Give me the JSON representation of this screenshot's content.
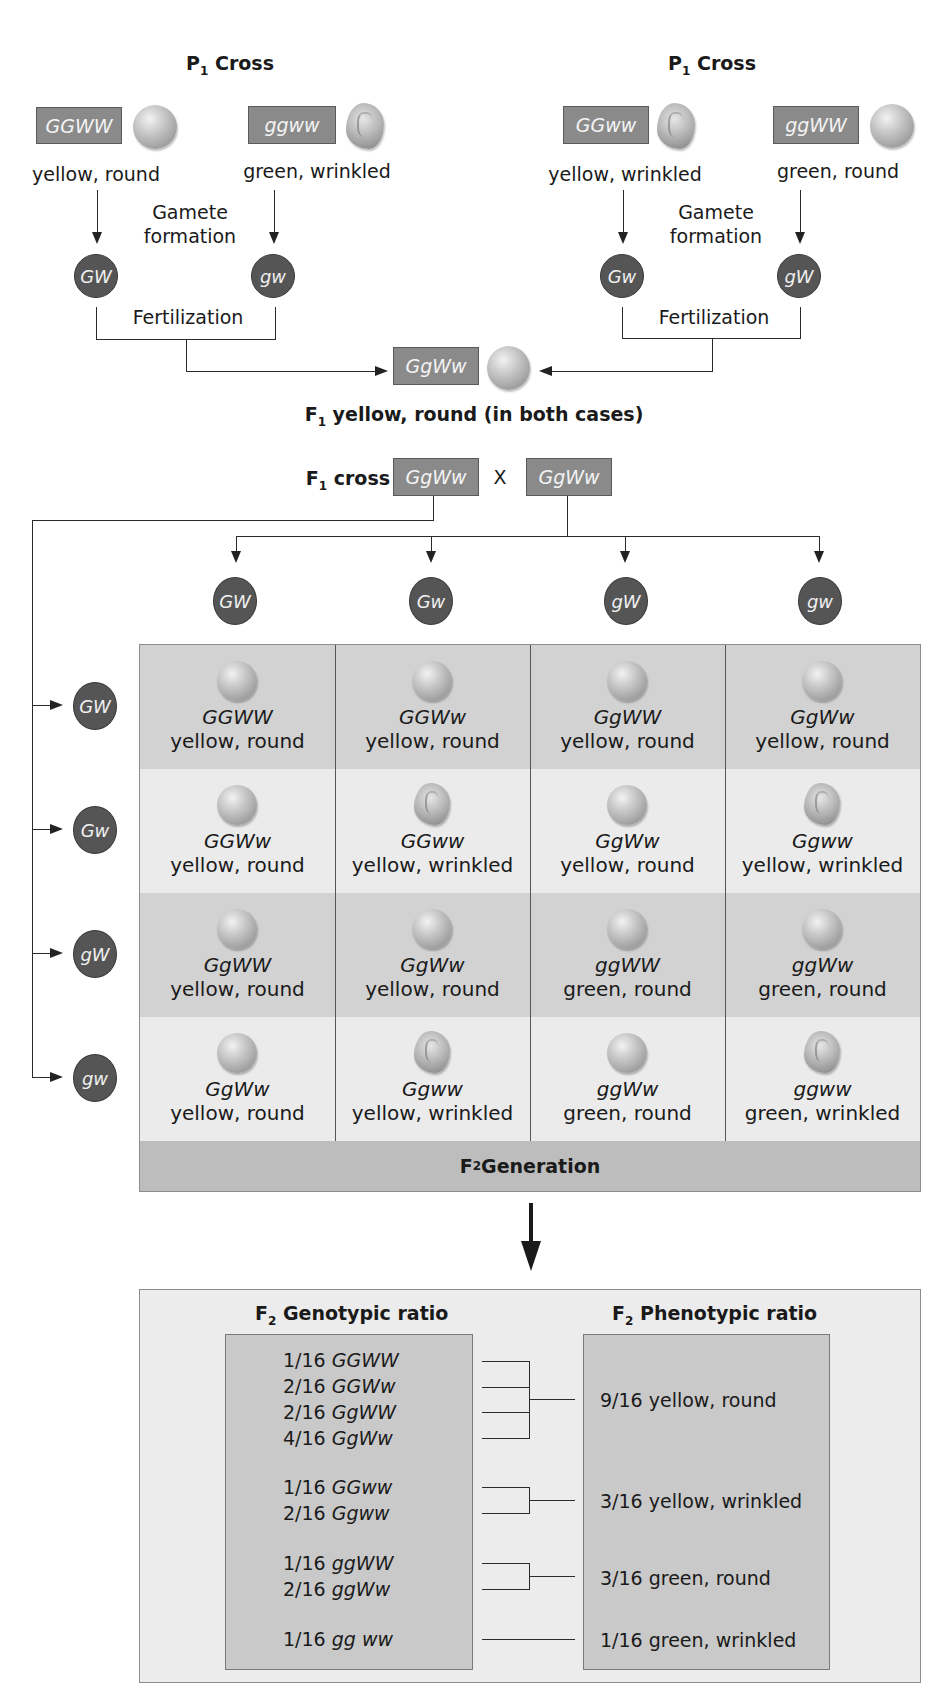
{
  "p1_crosses": [
    {
      "title": "P",
      "title_sub": "1",
      "title_suffix": " Cross",
      "parents": [
        {
          "genotype": "GGWW",
          "phenotype": "yellow, round",
          "seed_shape": "round"
        },
        {
          "genotype": "ggww",
          "phenotype": "green, wrinkled",
          "seed_shape": "wrinkled"
        }
      ],
      "gamete_label": "Gamete formation",
      "gametes": [
        "GW",
        "gw"
      ],
      "fertilization_label": "Fertilization"
    },
    {
      "title": "P",
      "title_sub": "1",
      "title_suffix": " Cross",
      "parents": [
        {
          "genotype": "GGww",
          "phenotype": "yellow, wrinkled",
          "seed_shape": "wrinkled"
        },
        {
          "genotype": "ggWW",
          "phenotype": "green, round",
          "seed_shape": "round"
        }
      ],
      "gamete_label": "Gamete formation",
      "gametes": [
        "Gw",
        "gW"
      ],
      "fertilization_label": "Fertilization"
    }
  ],
  "f1": {
    "genotype": "GgWw",
    "caption_prefix": "F",
    "caption_sub": "1",
    "caption_text": " yellow, round (in both cases)"
  },
  "f1_cross": {
    "label_prefix": "F",
    "label_sub": "1",
    "label_text": " cross",
    "left": "GgWw",
    "operator": "X",
    "right": "GgWw"
  },
  "punnett": {
    "column_gametes": [
      "GW",
      "Gw",
      "gW",
      "gw"
    ],
    "row_gametes": [
      "GW",
      "Gw",
      "gW",
      "gw"
    ],
    "rows": [
      [
        {
          "genotype": "GGWW",
          "phenotype": "yellow, round",
          "shape": "round"
        },
        {
          "genotype": "GGWw",
          "phenotype": "yellow, round",
          "shape": "round"
        },
        {
          "genotype": "GgWW",
          "phenotype": "yellow, round",
          "shape": "round"
        },
        {
          "genotype": "GgWw",
          "phenotype": "yellow, round",
          "shape": "round"
        }
      ],
      [
        {
          "genotype": "GGWw",
          "phenotype": "yellow, round",
          "shape": "round"
        },
        {
          "genotype": "GGww",
          "phenotype": "yellow, wrinkled",
          "shape": "wrinkled"
        },
        {
          "genotype": "GgWw",
          "phenotype": "yellow, round",
          "shape": "round"
        },
        {
          "genotype": "Ggww",
          "phenotype": "yellow, wrinkled",
          "shape": "wrinkled"
        }
      ],
      [
        {
          "genotype": "GgWW",
          "phenotype": "yellow, round",
          "shape": "round"
        },
        {
          "genotype": "GgWw",
          "phenotype": "yellow, round",
          "shape": "round"
        },
        {
          "genotype": "ggWW",
          "phenotype": "green, round",
          "shape": "round"
        },
        {
          "genotype": "ggWw",
          "phenotype": "green, round",
          "shape": "round"
        }
      ],
      [
        {
          "genotype": "GgWw",
          "phenotype": "yellow, round",
          "shape": "round"
        },
        {
          "genotype": "Ggww",
          "phenotype": "yellow, wrinkled",
          "shape": "wrinkled"
        },
        {
          "genotype": "ggWw",
          "phenotype": "green, round",
          "shape": "round"
        },
        {
          "genotype": "ggww",
          "phenotype": "green, wrinkled",
          "shape": "wrinkled"
        }
      ]
    ],
    "footer_prefix": "F",
    "footer_sub": "2",
    "footer_text": " Generation"
  },
  "ratios": {
    "genotypic_title_prefix": "F",
    "genotypic_title_sub": "2",
    "genotypic_title_text": " Genotypic ratio",
    "phenotypic_title_prefix": "F",
    "phenotypic_title_sub": "2",
    "phenotypic_title_text": " Phenotypic ratio",
    "genotypic": [
      {
        "fraction": "1/16",
        "genotype": "GGWW"
      },
      {
        "fraction": "2/16",
        "genotype": "GGWw"
      },
      {
        "fraction": "2/16",
        "genotype": "GgWW"
      },
      {
        "fraction": "4/16",
        "genotype": "GgWw"
      },
      {
        "fraction": "1/16",
        "genotype": "GGww"
      },
      {
        "fraction": "2/16",
        "genotype": "Ggww"
      },
      {
        "fraction": "1/16",
        "genotype": "ggWW"
      },
      {
        "fraction": "2/16",
        "genotype": "ggWw"
      },
      {
        "fraction": "1/16",
        "genotype": "gg ww"
      }
    ],
    "phenotypic": [
      {
        "fraction": "9/16",
        "phenotype": "yellow, round"
      },
      {
        "fraction": "3/16",
        "phenotype": "yellow, wrinkled"
      },
      {
        "fraction": "3/16",
        "phenotype": "green, round"
      },
      {
        "fraction": "1/16",
        "phenotype": "green, wrinkled"
      }
    ]
  },
  "colors": {
    "genotype_box": "#8a8a8a",
    "gamete_circle": "#555555",
    "grid_dark_row": "#d2d2d2",
    "grid_light_row": "#ebebeb",
    "f2_band": "#bdbdbd"
  }
}
